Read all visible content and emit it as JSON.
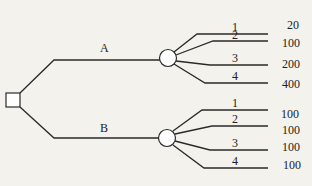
{
  "diagram": {
    "type": "decision-tree",
    "decision_node": {
      "shape": "square"
    },
    "branches": [
      {
        "label": "A",
        "chance_node": {
          "shape": "circle"
        },
        "outcomes": [
          {
            "label": "1",
            "payoff": "20"
          },
          {
            "label": "2",
            "payoff": "100"
          },
          {
            "label": "3",
            "payoff": "200"
          },
          {
            "label": "4",
            "payoff": "400"
          }
        ]
      },
      {
        "label": "B",
        "chance_node": {
          "shape": "circle"
        },
        "outcomes": [
          {
            "label": "1",
            "payoff": "100"
          },
          {
            "label": "2",
            "payoff": "100"
          },
          {
            "label": "3",
            "payoff": "100"
          },
          {
            "label": "4",
            "payoff": "100"
          }
        ]
      }
    ]
  },
  "colors": {
    "background": "#f4f2ec",
    "line": "#2a2a2a"
  }
}
